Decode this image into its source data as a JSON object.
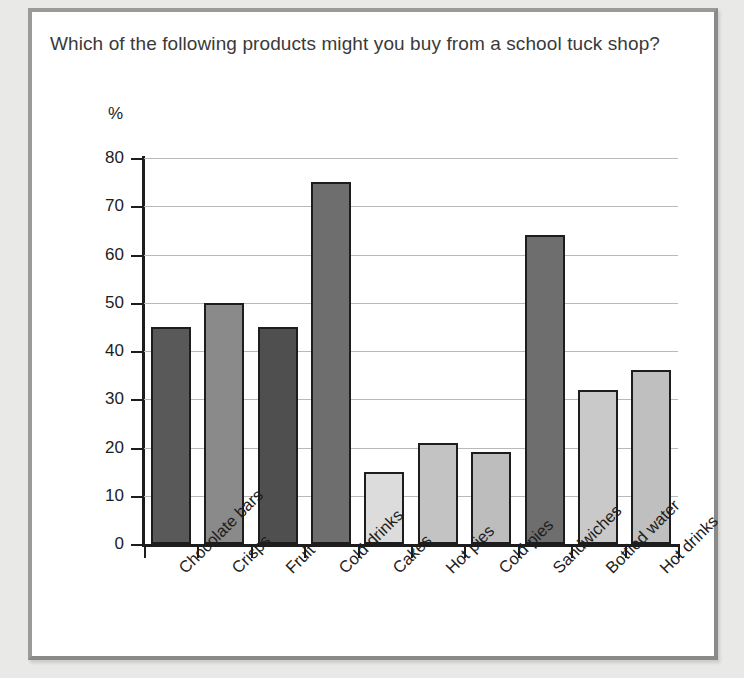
{
  "question": "Which of the following products might you buy from a school tuck shop?",
  "chart_data": {
    "type": "bar",
    "title": "Which of the following products might you buy from a school tuck shop?",
    "xlabel": "",
    "ylabel": "%",
    "ylim": [
      0,
      80
    ],
    "ytick_step": 10,
    "yticks": [
      "80",
      "70",
      "60",
      "50",
      "40",
      "30",
      "20",
      "10",
      "0"
    ],
    "grid": true,
    "legend": "none",
    "categories": [
      "Chocolate bars",
      "Crisps",
      "Fruit",
      "Cold drinks",
      "Cakes",
      "Hot pies",
      "Cold pies",
      "Sandwiches",
      "Bottled water",
      "Hot drinks"
    ],
    "values": [
      45,
      50,
      45,
      75,
      15,
      21,
      19,
      64,
      32,
      36
    ],
    "bar_colors": [
      "#595959",
      "#8a8a8a",
      "#4f4f4f",
      "#6e6e6e",
      "#dcdcdc",
      "#c3c3c3",
      "#bdbdbd",
      "#6e6e6e",
      "#c9c9c9",
      "#bfbfbf"
    ]
  },
  "style": {
    "page_background": "#e9e9e7",
    "card_background": "#ffffff",
    "card_border": "#8a8a8a",
    "axis_color": "#1d1d1d",
    "grid_color": "#b9b9b9",
    "text_color": "#3a3a3a"
  }
}
